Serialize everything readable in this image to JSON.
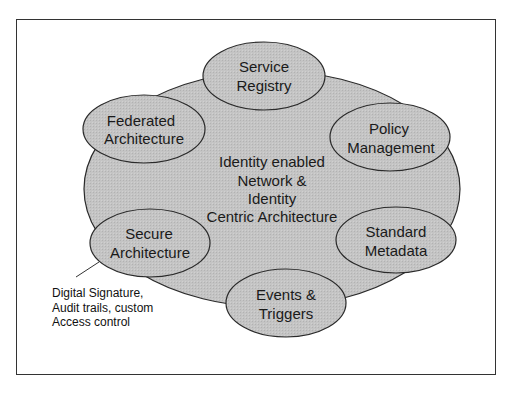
{
  "diagram": {
    "center": {
      "lines": [
        "Identity enabled",
        "Network &",
        "Identity",
        "Centric Architecture"
      ]
    },
    "nodes": [
      {
        "id": "service-registry",
        "lines": [
          "Service",
          "Registry"
        ]
      },
      {
        "id": "federated-architecture",
        "lines": [
          "Federated",
          "Architecture"
        ]
      },
      {
        "id": "policy-management",
        "lines": [
          "Policy",
          "Management"
        ]
      },
      {
        "id": "secure-architecture",
        "lines": [
          "Secure",
          "Architecture"
        ]
      },
      {
        "id": "standard-metadata",
        "lines": [
          "Standard",
          "Metadata"
        ]
      },
      {
        "id": "events-triggers",
        "lines": [
          "Events &",
          "Triggers"
        ]
      }
    ],
    "annotation": {
      "target": "secure-architecture",
      "lines": [
        "Digital Signature,",
        "Audit trails, custom",
        "Access control"
      ]
    },
    "colors": {
      "fill": "#c2c2c2",
      "stroke": "#2a2a2a",
      "border": "#333333",
      "background": "#ffffff"
    }
  }
}
